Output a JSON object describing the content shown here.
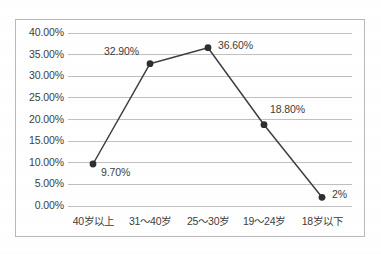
{
  "chart_data": {
    "type": "line",
    "title": "",
    "subtitle": "",
    "xlabel": "",
    "ylabel": "",
    "categories": [
      "40岁以上",
      "31～40岁",
      "25～30岁",
      "19～24岁",
      "18岁以下"
    ],
    "values": [
      9.7,
      32.9,
      36.6,
      18.8,
      2
    ],
    "point_labels": [
      "9.70%",
      "32.90%",
      "36.60%",
      "18.80%",
      "2%"
    ],
    "ylim": [
      0,
      40
    ],
    "ytick_step": 5,
    "ytick_labels": [
      "0.00%",
      "5.00%",
      "10.00%",
      "15.00%",
      "20.00%",
      "25.00%",
      "30.00%",
      "35.00%",
      "40.00%"
    ],
    "grid": "horizontal",
    "legend": "none",
    "series": [
      {
        "name": "",
        "values": [
          9.7,
          32.9,
          36.6,
          18.8,
          2
        ],
        "line_color": "#404040",
        "marker_color": "#2f2f2f",
        "marker": "circle"
      }
    ],
    "colors": {
      "line": "#404040",
      "marker": "#2f2f2f",
      "gridline": "#c0c0c0",
      "border": "#b9b9b9",
      "text": "#3d3d3d",
      "background": "#ffffff"
    },
    "label_positions": [
      {
        "label": "9.70%",
        "anchor": "below-right"
      },
      {
        "label": "32.90%",
        "anchor": "above-left"
      },
      {
        "label": "36.60%",
        "anchor": "right"
      },
      {
        "label": "18.80%",
        "anchor": "above-right"
      },
      {
        "label": "2%",
        "anchor": "right"
      }
    ]
  }
}
